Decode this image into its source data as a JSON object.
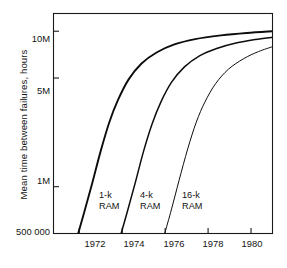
{
  "chart_data": {
    "type": "line",
    "title": "",
    "xlabel": "",
    "ylabel": "Mean time between failures, hours",
    "x_tick_labels": [
      "1972",
      "1974",
      "1976",
      "1978",
      "1980"
    ],
    "x_tick_values": [
      1972,
      1974,
      1976,
      1978,
      1980
    ],
    "y_tick_labels": [
      "10M",
      "5M",
      "1M",
      "500 000"
    ],
    "y_tick_values": [
      10000000,
      5000000,
      1000000,
      500000
    ],
    "y_scale": "log",
    "x_scale": "linear",
    "ylim": [
      500000,
      13000000
    ],
    "xlim": [
      1970.8,
      1981.0
    ],
    "grid": false,
    "legend": "inline-labels",
    "series": [
      {
        "name": "1-k RAM",
        "label": "1-k",
        "label_line2": "RAM",
        "stroke_width": 1.9,
        "points": [
          {
            "x": 1971.95,
            "y": 500000
          },
          {
            "x": 1972.25,
            "y": 700000
          },
          {
            "x": 1972.6,
            "y": 1050000
          },
          {
            "x": 1973.0,
            "y": 1700000
          },
          {
            "x": 1973.4,
            "y": 2600000
          },
          {
            "x": 1973.8,
            "y": 3600000
          },
          {
            "x": 1974.3,
            "y": 4900000
          },
          {
            "x": 1974.9,
            "y": 6200000
          },
          {
            "x": 1975.6,
            "y": 7300000
          },
          {
            "x": 1976.4,
            "y": 8200000
          },
          {
            "x": 1977.4,
            "y": 8900000
          },
          {
            "x": 1978.6,
            "y": 9400000
          },
          {
            "x": 1979.8,
            "y": 9750000
          },
          {
            "x": 1981.0,
            "y": 10000000
          }
        ]
      },
      {
        "name": "4-k RAM",
        "label": "4-k",
        "label_line2": "RAM",
        "stroke_width": 1.5,
        "points": [
          {
            "x": 1973.95,
            "y": 500000
          },
          {
            "x": 1974.25,
            "y": 700000
          },
          {
            "x": 1974.6,
            "y": 1050000
          },
          {
            "x": 1975.0,
            "y": 1700000
          },
          {
            "x": 1975.4,
            "y": 2550000
          },
          {
            "x": 1975.8,
            "y": 3500000
          },
          {
            "x": 1976.3,
            "y": 4700000
          },
          {
            "x": 1976.9,
            "y": 5900000
          },
          {
            "x": 1977.6,
            "y": 6950000
          },
          {
            "x": 1978.4,
            "y": 7750000
          },
          {
            "x": 1979.3,
            "y": 8400000
          },
          {
            "x": 1980.2,
            "y": 8850000
          },
          {
            "x": 1981.0,
            "y": 9150000
          }
        ]
      },
      {
        "name": "16-k RAM",
        "label": "16-k",
        "label_line2": "RAM",
        "stroke_width": 1.0,
        "points": [
          {
            "x": 1975.98,
            "y": 500000
          },
          {
            "x": 1976.3,
            "y": 720000
          },
          {
            "x": 1976.65,
            "y": 1100000
          },
          {
            "x": 1977.05,
            "y": 1750000
          },
          {
            "x": 1977.45,
            "y": 2600000
          },
          {
            "x": 1977.85,
            "y": 3500000
          },
          {
            "x": 1978.35,
            "y": 4600000
          },
          {
            "x": 1978.95,
            "y": 5700000
          },
          {
            "x": 1979.65,
            "y": 6650000
          },
          {
            "x": 1980.35,
            "y": 7400000
          },
          {
            "x": 1981.0,
            "y": 7950000
          }
        ]
      }
    ]
  },
  "axes": {
    "frame_color": "#1a1a1a",
    "tick_color": "#1a1a1a"
  }
}
